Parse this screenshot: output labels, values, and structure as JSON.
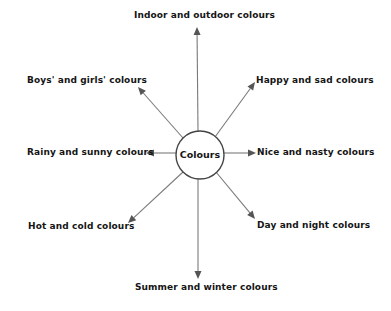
{
  "diagram": {
    "type": "spider-diagram",
    "center": {
      "label": "Colours",
      "x": 200,
      "y": 155,
      "radius": 24
    },
    "colors": {
      "line": "#7a7a7a",
      "arrowhead": "#555555",
      "circle": "#444444",
      "text": "#151515",
      "background": "#ffffff"
    },
    "branches": [
      {
        "id": "top",
        "label": "Indoor and outdoor colours",
        "from": [
          198,
          131
        ],
        "to": [
          197,
          27
        ],
        "label_pos": [
          134,
          10
        ],
        "direction": "up"
      },
      {
        "id": "upper-left",
        "label": "Boys' and girls' colours",
        "from": [
          183,
          138
        ],
        "to": [
          138,
          87
        ],
        "label_pos": [
          27,
          75
        ],
        "direction": "up-left"
      },
      {
        "id": "upper-right",
        "label": "Happy and sad colours",
        "from": [
          215,
          137
        ],
        "to": [
          255,
          82
        ],
        "label_pos": [
          256,
          75
        ],
        "direction": "up-right"
      },
      {
        "id": "left",
        "label": "Rainy and sunny colours",
        "from": [
          176,
          153
        ],
        "to": [
          146,
          153
        ],
        "label_pos": [
          27,
          147
        ],
        "direction": "left"
      },
      {
        "id": "right",
        "label": "Nice and nasty colours",
        "from": [
          224,
          153
        ],
        "to": [
          256,
          153
        ],
        "label_pos": [
          257,
          147
        ],
        "direction": "right"
      },
      {
        "id": "lower-left",
        "label": "Hot and cold colours",
        "from": [
          183,
          172
        ],
        "to": [
          128,
          223
        ],
        "label_pos": [
          28,
          221
        ],
        "direction": "down-left"
      },
      {
        "id": "lower-right",
        "label": "Day and night colours",
        "from": [
          216,
          172
        ],
        "to": [
          255,
          219
        ],
        "label_pos": [
          257,
          220
        ],
        "direction": "down-right"
      },
      {
        "id": "bottom",
        "label": "Summer and winter colours",
        "from": [
          198,
          179
        ],
        "to": [
          198,
          279
        ],
        "label_pos": [
          135,
          282
        ],
        "direction": "down"
      }
    ]
  }
}
